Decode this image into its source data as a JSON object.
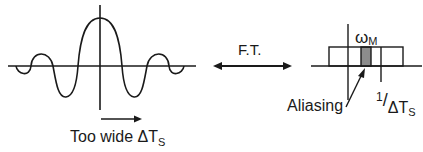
{
  "diagram": {
    "left_panel": {
      "title": "sinc-like time-domain signal",
      "caption_main": "Too wide ",
      "caption_delta": "ΔT",
      "caption_sub": "S"
    },
    "transform": {
      "label": "F.T."
    },
    "right_panel": {
      "omega_symbol": "ω",
      "omega_sub": "M",
      "aliasing_label": "Aliasing",
      "period_numerator": "1",
      "period_slash": "/",
      "period_delta": "ΔT",
      "period_sub": "S"
    },
    "colors": {
      "stroke": "#1a1a1a",
      "aliasing_fill": "#8c8c8c"
    }
  }
}
